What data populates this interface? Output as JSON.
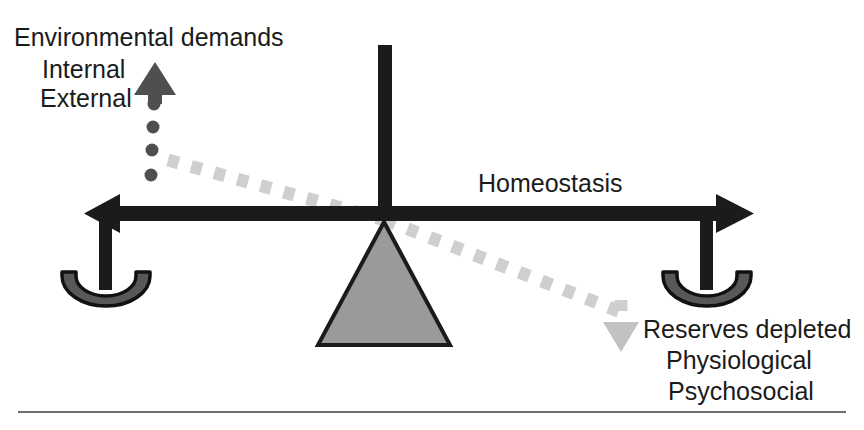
{
  "figure": {
    "type": "balance-scale-diagram",
    "title_concept": "Homeostasis balance between environmental demands and depleted reserves",
    "background_color": "#ffffff"
  },
  "labels": {
    "environmental_demands": "Environmental demands",
    "internal": "Internal",
    "external": "External",
    "homeostasis": "Homeostasis",
    "reserves_depleted": "Reserves depleted",
    "physiological": "Physiological",
    "psychosocial": "Psychosocial"
  },
  "colors": {
    "beam": "#1b1b1b",
    "text": "#1b1b1b",
    "fulcrum_fill": "#9a9a9a",
    "fulcrum_stroke": "#1b1b1b",
    "pan_fill": "#585858",
    "pan_stroke": "#111111",
    "up_arrow": "#4f4f4f",
    "down_arrow": "#c2c2c2",
    "dotted_line": "#cccccc",
    "dot_column": "#4f4f4f",
    "rule": "#6d6d6d"
  },
  "elements": {
    "beam": {
      "name": "horizontal-beam",
      "left_arrow": "left-pointing",
      "right_arrow": "right-pointing"
    },
    "pole": {
      "name": "vertical-pole"
    },
    "fulcrum": {
      "name": "fulcrum-triangle",
      "shape": "triangle"
    },
    "left_pan": {
      "name": "left-balance-pan"
    },
    "right_pan": {
      "name": "right-balance-pan"
    },
    "up_arrow": {
      "name": "up-arrow",
      "direction": "up"
    },
    "down_arrow": {
      "name": "down-arrow",
      "direction": "down"
    },
    "dotted_diagonal": {
      "name": "dotted-tilt-indicator"
    },
    "dot_column": {
      "name": "vertical-dot-column",
      "dot_count": 4
    },
    "caption_rule": {
      "name": "caption-divider-rule"
    }
  }
}
